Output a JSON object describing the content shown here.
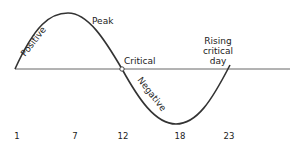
{
  "diagram": {
    "type": "biorhythm-cycle",
    "labels": {
      "positive": "Positive",
      "peak": "Peak",
      "critical": "Critical",
      "negative": "Negative",
      "rising_line1": "Rising",
      "rising_line2": "critical",
      "rising_line3": "day"
    },
    "day_ticks": [
      "1",
      "7",
      "12",
      "18",
      "23"
    ],
    "colors": {
      "curve": "#333333",
      "axis": "#555555"
    }
  }
}
